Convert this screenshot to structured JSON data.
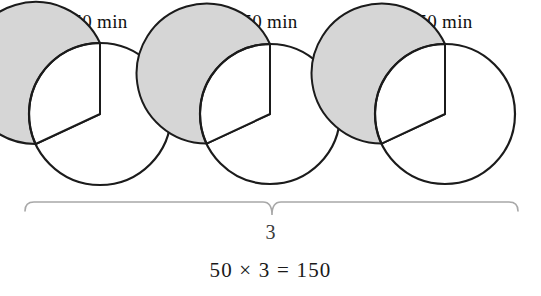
{
  "figure": {
    "width": 541,
    "height": 296,
    "background": "#ffffff"
  },
  "pies": [
    {
      "label": "50 min",
      "center_x": 100,
      "center_y": 114,
      "radius": 71,
      "shaded_fraction": 0.8333,
      "white_fraction": 0.1667,
      "white_start_deg": 0,
      "white_end_deg": 115,
      "fill_color": "#d6d6d6",
      "empty_color": "#ffffff",
      "stroke_color": "#1b1b1b",
      "label_x": 100,
      "label_y": 12
    },
    {
      "label": "50 min",
      "center_x": 270,
      "center_y": 114,
      "radius": 70,
      "shaded_fraction": 0.8333,
      "white_fraction": 0.1667,
      "white_start_deg": 0,
      "white_end_deg": 115,
      "fill_color": "#d6d6d6",
      "empty_color": "#ffffff",
      "stroke_color": "#1b1b1b",
      "label_x": 270,
      "label_y": 12
    },
    {
      "label": "50 min",
      "center_x": 445,
      "center_y": 114,
      "radius": 70,
      "shaded_fraction": 0.8333,
      "white_fraction": 0.1667,
      "white_start_deg": 0,
      "white_end_deg": 115,
      "fill_color": "#d6d6d6",
      "empty_color": "#ffffff",
      "stroke_color": "#1b1b1b",
      "label_x": 445,
      "label_y": 12
    }
  ],
  "brace": {
    "left_x": 25,
    "right_x": 518,
    "top_y": 12,
    "tip_y": 25,
    "mid_x": 272,
    "color": "#a8a8a8",
    "stroke_width": 1.6
  },
  "count": {
    "text": "3"
  },
  "equation": {
    "text": "50 × 3 = 150",
    "left_operand": "50",
    "operator": "×",
    "right_operand": "3",
    "equals": "=",
    "result": "150"
  },
  "chart_data": {
    "type": "pie",
    "title": "",
    "subtitle": "",
    "xlabel": "",
    "ylabel": "",
    "legend": [],
    "annotations": [
      "50 min",
      "50 min",
      "50 min",
      "3",
      "50 × 3 = 150"
    ],
    "repeat_count": 3,
    "unit_value": 50,
    "unit": "min",
    "total": 150,
    "charts": [
      {
        "label": "50 min",
        "slices": [
          {
            "name": "shaded",
            "value": 50,
            "fraction": 0.8333,
            "color": "#d6d6d6"
          },
          {
            "name": "unshaded",
            "value": 10,
            "fraction": 0.1667,
            "color": "#ffffff"
          }
        ]
      },
      {
        "label": "50 min",
        "slices": [
          {
            "name": "shaded",
            "value": 50,
            "fraction": 0.8333,
            "color": "#d6d6d6"
          },
          {
            "name": "unshaded",
            "value": 10,
            "fraction": 0.1667,
            "color": "#ffffff"
          }
        ]
      },
      {
        "label": "50 min",
        "slices": [
          {
            "name": "shaded",
            "value": 50,
            "fraction": 0.8333,
            "color": "#d6d6d6"
          },
          {
            "name": "unshaded",
            "value": 10,
            "fraction": 0.1667,
            "color": "#ffffff"
          }
        ]
      }
    ]
  }
}
